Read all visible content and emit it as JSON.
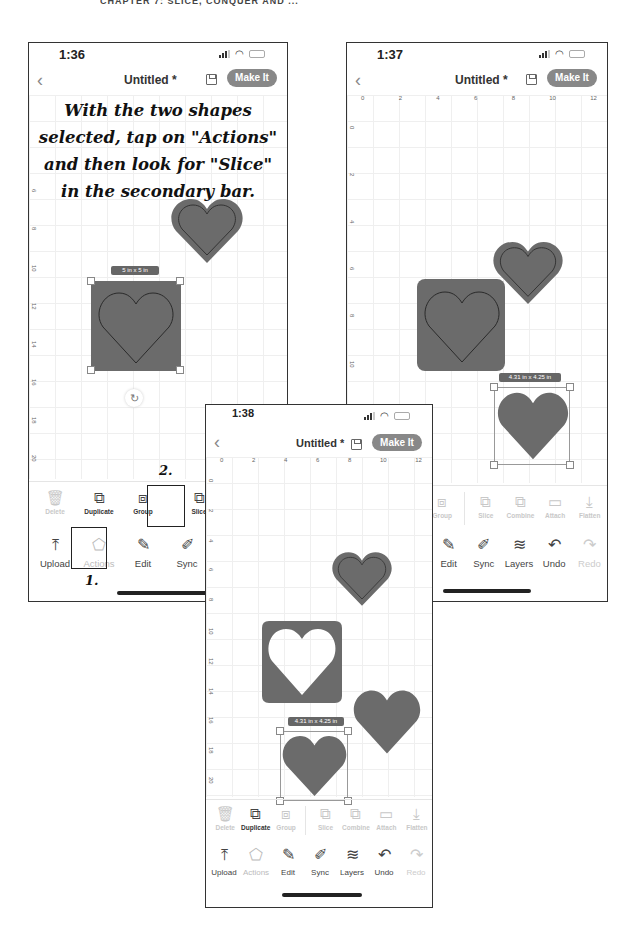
{
  "page_header": "CHAPTER 7: SLICE, CONQUER AND ...",
  "phones": [
    {
      "time": "1:36",
      "title": "Untitled *",
      "make_it": "Make It",
      "instruction": "With the two shapes selected, tap on \"Actions\" and then look for \"Slice\" in the secondary bar.",
      "ruler_left": [
        "6",
        "8",
        "10",
        "12",
        "14",
        "16",
        "18",
        "20"
      ],
      "dimension_label": "5 in x 5 in",
      "secondary_toolbar": [
        {
          "label": "Delete",
          "icon": "trash-icon",
          "glyph": "🗑",
          "disabled": true
        },
        {
          "label": "Duplicate",
          "icon": "duplicate-icon",
          "glyph": "⧉",
          "disabled": false
        },
        {
          "label": "Group",
          "icon": "group-icon",
          "glyph": "⧈",
          "disabled": false
        },
        {
          "label": "Slice",
          "icon": "slice-icon",
          "glyph": "⧉",
          "disabled": false
        },
        {
          "label": "Combi",
          "icon": "combine-icon",
          "glyph": "⧉",
          "disabled": false
        }
      ],
      "primary_toolbar": [
        {
          "label": "Upload",
          "icon": "upload-icon",
          "glyph": "⤒",
          "disabled": false
        },
        {
          "label": "Actions",
          "icon": "actions-icon",
          "glyph": "⬠",
          "disabled": true
        },
        {
          "label": "Edit",
          "icon": "edit-icon",
          "glyph": "✎",
          "disabled": false
        },
        {
          "label": "Sync",
          "icon": "sync-icon",
          "glyph": "✐",
          "disabled": false
        },
        {
          "label": "Layers",
          "icon": "layers-icon",
          "glyph": "≋",
          "disabled": false
        }
      ],
      "callouts": [
        {
          "number": "2."
        },
        {
          "number": "1."
        }
      ]
    },
    {
      "time": "1:37",
      "title": "Untitled *",
      "make_it": "Make It",
      "ruler_top": [
        "0",
        "2",
        "4",
        "6",
        "8",
        "10",
        "12"
      ],
      "ruler_left": [
        "0",
        "2",
        "4",
        "6",
        "8",
        "10",
        "12",
        "14"
      ],
      "dimension_label": "4.31 in x 4.25 in",
      "secondary_toolbar": [
        {
          "label": "Group",
          "icon": "group-icon",
          "glyph": "⧈",
          "disabled": true
        },
        {
          "label": "Slice",
          "icon": "slice-icon",
          "glyph": "⧉",
          "disabled": true
        },
        {
          "label": "Combine",
          "icon": "combine-icon",
          "glyph": "⧉",
          "disabled": true
        },
        {
          "label": "Attach",
          "icon": "attach-icon",
          "glyph": "▭",
          "disabled": true
        },
        {
          "label": "Flatten",
          "icon": "flatten-icon",
          "glyph": "⤓",
          "disabled": true
        }
      ],
      "primary_toolbar": [
        {
          "label": "Edit",
          "icon": "edit-icon",
          "glyph": "✎",
          "disabled": false
        },
        {
          "label": "Sync",
          "icon": "sync-icon",
          "glyph": "✐",
          "disabled": false
        },
        {
          "label": "Layers",
          "icon": "layers-icon",
          "glyph": "≋",
          "disabled": false
        },
        {
          "label": "Undo",
          "icon": "undo-icon",
          "glyph": "↶",
          "disabled": false
        },
        {
          "label": "Redo",
          "icon": "redo-icon",
          "glyph": "↷",
          "disabled": true
        }
      ]
    },
    {
      "time": "1:38",
      "title": "Untitled *",
      "make_it": "Make It",
      "ruler_top": [
        "0",
        "2",
        "4",
        "6",
        "8",
        "10",
        "12"
      ],
      "ruler_left": [
        "0",
        "2",
        "4",
        "6",
        "8",
        "10",
        "12",
        "14",
        "16",
        "18",
        "20"
      ],
      "dimension_label": "4.31 in x 4.25 in",
      "secondary_toolbar": [
        {
          "label": "Delete",
          "icon": "trash-icon",
          "glyph": "🗑",
          "disabled": true
        },
        {
          "label": "Duplicate",
          "icon": "duplicate-icon",
          "glyph": "⧉",
          "disabled": false
        },
        {
          "label": "Group",
          "icon": "group-icon",
          "glyph": "⧈",
          "disabled": true
        },
        {
          "label": "Slice",
          "icon": "slice-icon",
          "glyph": "⧉",
          "disabled": true
        },
        {
          "label": "Combine",
          "icon": "combine-icon",
          "glyph": "⧉",
          "disabled": true
        },
        {
          "label": "Attach",
          "icon": "attach-icon",
          "glyph": "▭",
          "disabled": true
        },
        {
          "label": "Flatten",
          "icon": "flatten-icon",
          "glyph": "⤓",
          "disabled": true
        }
      ],
      "primary_toolbar": [
        {
          "label": "Upload",
          "icon": "upload-icon",
          "glyph": "⤒",
          "disabled": false
        },
        {
          "label": "Actions",
          "icon": "actions-icon",
          "glyph": "⬠",
          "disabled": true
        },
        {
          "label": "Edit",
          "icon": "edit-icon",
          "glyph": "✎",
          "disabled": false
        },
        {
          "label": "Sync",
          "icon": "sync-icon",
          "glyph": "✐",
          "disabled": false
        },
        {
          "label": "Layers",
          "icon": "layers-icon",
          "glyph": "≋",
          "disabled": false
        },
        {
          "label": "Undo",
          "icon": "undo-icon",
          "glyph": "↶",
          "disabled": false
        },
        {
          "label": "Redo",
          "icon": "redo-icon",
          "glyph": "↷",
          "disabled": true
        }
      ]
    }
  ],
  "colors": {
    "shape_fill": "#6b6b6b",
    "shape_outline": "#3a3a3a",
    "make_it_bg": "#888888",
    "disabled": "#c8c8c8"
  }
}
